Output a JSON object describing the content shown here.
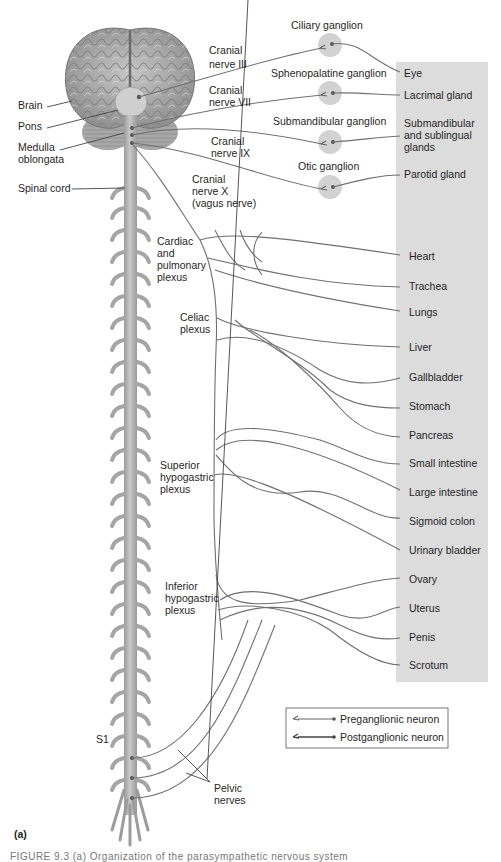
{
  "figure": {
    "panel_label": "(a)",
    "caption_partial": "FIGURE 9.3   (a) Organization of the parasympathetic nervous system"
  },
  "anatomy_labels": {
    "brain": "Brain",
    "pons": "Pons",
    "medulla": [
      "Medulla",
      "oblongata"
    ],
    "spinal_cord": "Spinal cord",
    "s1": "S1"
  },
  "cranial_nerves": [
    {
      "lines": [
        "Cranial",
        "nerve III"
      ]
    },
    {
      "lines": [
        "Cranial",
        "nerve VII"
      ]
    },
    {
      "lines": [
        "Cranial",
        "nerve IX"
      ]
    },
    {
      "lines": [
        "Cranial",
        "nerve X",
        "(vagus nerve)"
      ]
    }
  ],
  "ganglia": [
    {
      "name": "Ciliary ganglion",
      "target": [
        "Eye"
      ]
    },
    {
      "name": "Sphenopalatine ganglion",
      "target": [
        "Lacrimal gland"
      ]
    },
    {
      "name": "Submandibular ganglion",
      "target": [
        "Submandibular",
        "and sublingual",
        "glands"
      ]
    },
    {
      "name": "Otic ganglion",
      "target": [
        "Parotid gland"
      ]
    }
  ],
  "plexuses": [
    {
      "lines": [
        "Cardiac",
        "and",
        "pulmonary",
        "plexus"
      ]
    },
    {
      "lines": [
        "Celiac",
        "plexus"
      ]
    },
    {
      "lines": [
        "Superior",
        "hypogastric",
        "plexus"
      ]
    },
    {
      "lines": [
        "Inferior",
        "hypogastric",
        "plexus"
      ]
    }
  ],
  "pelvic_nerves": [
    "Pelvic",
    "nerves"
  ],
  "organs": [
    "Heart",
    "Trachea",
    "Lungs",
    "Liver",
    "Gallbladder",
    "Stomach",
    "Pancreas",
    "Small intestine",
    "Large intestine",
    "Sigmoid colon",
    "Urinary bladder",
    "Ovary",
    "Uterus",
    "Penis",
    "Scrotum"
  ],
  "legend": {
    "items": [
      {
        "label": "Preganglionic neuron"
      },
      {
        "label": "Postganglionic neuron"
      }
    ]
  },
  "colors": {
    "target_panel": "#dcdcdc",
    "ganglion_fill": "#d2d2d2",
    "nerve_stroke": "#6f6f6f",
    "brain_fill": "#a9a9a9",
    "spine_fill": "#b4b4b4"
  }
}
